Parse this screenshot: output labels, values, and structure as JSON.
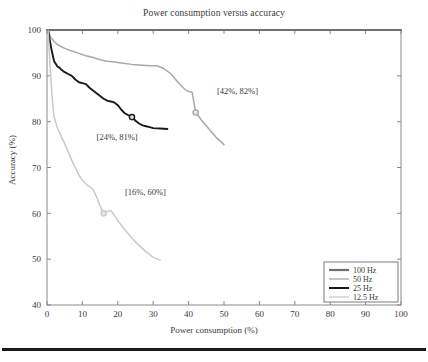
{
  "figure": {
    "title": "Power consumption versus accuracy",
    "bottom_rule": true
  },
  "axes": {
    "xlabel": "Power consumption (%)",
    "ylabel": "Accuracy (%)",
    "xticks": [
      "0",
      "10",
      "20",
      "30",
      "40",
      "50",
      "60",
      "70",
      "80",
      "90",
      "100"
    ],
    "yticks": [
      "40",
      "50",
      "60",
      "70",
      "80",
      "90",
      "100"
    ]
  },
  "legend": {
    "items": [
      {
        "label": "100 Hz",
        "color": "#707070"
      },
      {
        "label": "50 Hz",
        "color": "#a8a8a8"
      },
      {
        "label": "25 Hz",
        "color": "#1a1a1a"
      },
      {
        "label": "12.5 Hz",
        "color": "#c9c9c9"
      }
    ]
  },
  "annotations": [
    {
      "id": "annot-50hz",
      "text": "[42%, 82%]",
      "x": 42,
      "y": 82,
      "label_x": 48,
      "label_y": 86
    },
    {
      "id": "annot-25hz",
      "text": "[24%, 81%]",
      "x": 24,
      "y": 81,
      "label_x": 14,
      "label_y": 76
    },
    {
      "id": "annot-12_5hz",
      "text": "[16%, 60%]",
      "x": 16,
      "y": 60,
      "label_x": 22,
      "label_y": 64
    }
  ],
  "chart_data": {
    "type": "line",
    "title": "Power consumption versus accuracy",
    "xlabel": "Power consumption (%)",
    "ylabel": "Accuracy (%)",
    "xlim": [
      0,
      100
    ],
    "ylim": [
      40,
      100
    ],
    "xticks": [
      0,
      10,
      20,
      30,
      40,
      50,
      60,
      70,
      80,
      90,
      100
    ],
    "yticks": [
      40,
      50,
      60,
      70,
      80,
      90,
      100
    ],
    "grid": false,
    "legend_position": "lower right",
    "series": [
      {
        "name": "100 Hz",
        "color": "#707070",
        "points": [
          [
            0,
            100
          ],
          [
            100,
            100
          ]
        ]
      },
      {
        "name": "50 Hz",
        "color": "#a8a8a8",
        "points": [
          [
            0.3,
            100
          ],
          [
            1,
            98.5
          ],
          [
            2,
            97.5
          ],
          [
            3,
            96.8
          ],
          [
            4,
            96.4
          ],
          [
            5,
            96.0
          ],
          [
            7,
            95.4
          ],
          [
            9,
            94.9
          ],
          [
            11,
            94.4
          ],
          [
            13,
            94.0
          ],
          [
            15,
            93.5
          ],
          [
            17,
            93.2
          ],
          [
            19,
            93.0
          ],
          [
            21,
            92.8
          ],
          [
            24,
            92.5
          ],
          [
            27,
            92.3
          ],
          [
            29,
            92.2
          ],
          [
            31,
            92.2
          ],
          [
            33,
            91.6
          ],
          [
            35,
            90.4
          ],
          [
            37,
            88.6
          ],
          [
            39,
            87.0
          ],
          [
            40,
            86.6
          ],
          [
            41,
            86.4
          ],
          [
            42,
            82.0
          ],
          [
            44,
            80.0
          ],
          [
            46,
            78.2
          ],
          [
            48,
            76.4
          ],
          [
            50,
            75.0
          ]
        ],
        "marker": {
          "x": 42,
          "y": 82
        }
      },
      {
        "name": "25 Hz",
        "color": "#1a1a1a",
        "points": [
          [
            0.3,
            100
          ],
          [
            0.8,
            97.8
          ],
          [
            1.2,
            96.0
          ],
          [
            1.6,
            94.6
          ],
          [
            2,
            93.2
          ],
          [
            2.5,
            92.6
          ],
          [
            3,
            92.0
          ],
          [
            3.5,
            91.8
          ],
          [
            4,
            91.4
          ],
          [
            5,
            90.8
          ],
          [
            6,
            90.4
          ],
          [
            7,
            90.0
          ],
          [
            8,
            89.2
          ],
          [
            9,
            88.6
          ],
          [
            10,
            88.4
          ],
          [
            11,
            88.2
          ],
          [
            12,
            87.4
          ],
          [
            13,
            86.8
          ],
          [
            14,
            86.2
          ],
          [
            15,
            85.6
          ],
          [
            16,
            85.0
          ],
          [
            17,
            84.6
          ],
          [
            18,
            84.4
          ],
          [
            19,
            84.2
          ],
          [
            20,
            83.6
          ],
          [
            21,
            82.6
          ],
          [
            22,
            81.8
          ],
          [
            23,
            81.4
          ],
          [
            24,
            81.0
          ],
          [
            25,
            80.2
          ],
          [
            26,
            79.6
          ],
          [
            27,
            79.2
          ],
          [
            28,
            79.0
          ],
          [
            29,
            78.8
          ],
          [
            30,
            78.6
          ],
          [
            32,
            78.5
          ],
          [
            34,
            78.4
          ]
        ],
        "marker": {
          "x": 24,
          "y": 81
        }
      },
      {
        "name": "12.5 Hz",
        "color": "#c9c9c9",
        "points": [
          [
            0.3,
            100
          ],
          [
            0.8,
            93
          ],
          [
            1.2,
            88
          ],
          [
            1.6,
            84
          ],
          [
            2,
            81
          ],
          [
            3,
            78.5
          ],
          [
            4,
            76.8
          ],
          [
            5,
            75.2
          ],
          [
            6,
            73.4
          ],
          [
            7,
            71.6
          ],
          [
            8,
            70.0
          ],
          [
            9,
            68.4
          ],
          [
            10,
            67.2
          ],
          [
            11,
            66.4
          ],
          [
            12,
            65.8
          ],
          [
            13,
            65.2
          ],
          [
            14,
            63.6
          ],
          [
            15,
            61.6
          ],
          [
            16,
            60.0
          ],
          [
            17,
            60.4
          ],
          [
            18,
            60.6
          ],
          [
            19,
            59.6
          ],
          [
            20,
            58.4
          ],
          [
            22,
            56.4
          ],
          [
            24,
            54.6
          ],
          [
            26,
            53.0
          ],
          [
            28,
            51.6
          ],
          [
            30,
            50.4
          ],
          [
            32,
            49.8
          ]
        ],
        "marker": {
          "x": 16,
          "y": 60
        }
      }
    ]
  }
}
